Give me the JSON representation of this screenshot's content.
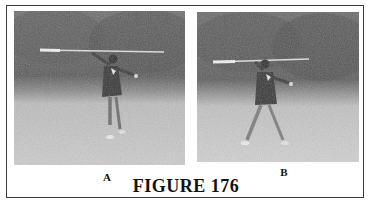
{
  "figure": {
    "caption": "FIGURE 176",
    "panels": [
      {
        "label": "A",
        "description": "Person in a grassy field holding a long spear overhead, drawn back in throwing stance, trees in background"
      },
      {
        "label": "B",
        "description": "Person in a grassy field stepping forward with spear raised horizontally, about to throw, trees in background"
      }
    ]
  },
  "colors": {
    "border": "#3a3a3a",
    "text": "#111111",
    "trees": "#5a5a5a",
    "grass": "#c4c4c4",
    "figure": "#3c3c3c"
  }
}
